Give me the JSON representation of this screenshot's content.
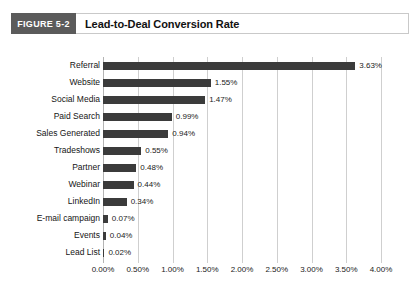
{
  "header": {
    "figure_tag": "FIGURE 5-2",
    "title": "Lead-to-Deal Conversion Rate"
  },
  "chart_data": {
    "type": "bar",
    "orientation": "horizontal",
    "title": "Lead-to-Deal Conversion Rate",
    "xlabel": "",
    "ylabel": "",
    "xlim": [
      0,
      4
    ],
    "xunit": "%",
    "xticks": [
      "0.00%",
      "0.50%",
      "1.00%",
      "1.50%",
      "2.00%",
      "2.50%",
      "3.00%",
      "3.50%",
      "4.00%"
    ],
    "xtick_values": [
      0,
      0.5,
      1.0,
      1.5,
      2.0,
      2.5,
      3.0,
      3.5,
      4.0
    ],
    "grid": true,
    "grid_axis": "x",
    "legend": false,
    "bar_color": "#3b3b3b",
    "grid_color": "#cfcfcf",
    "categories": [
      "Referral",
      "Website",
      "Social Media",
      "Paid Search",
      "Sales Generated",
      "Tradeshows",
      "Partner",
      "Webinar",
      "LinkedIn",
      "E-mail campaign",
      "Events",
      "Lead List"
    ],
    "values": [
      3.63,
      1.55,
      1.47,
      0.99,
      0.94,
      0.55,
      0.48,
      0.44,
      0.34,
      0.07,
      0.04,
      0.02
    ],
    "labels": [
      "3.63%",
      "1.55%",
      "1.47%",
      "0.99%",
      "0.94%",
      "0.55%",
      "0.48%",
      "0.44%",
      "0.34%",
      "0.07%",
      "0.04%",
      "0.02%"
    ]
  }
}
